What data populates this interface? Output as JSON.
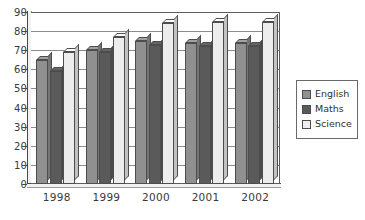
{
  "chart_data": {
    "type": "bar",
    "title": "",
    "xlabel": "",
    "ylabel": "",
    "categories": [
      "1998",
      "1999",
      "2000",
      "2001",
      "2002"
    ],
    "series": [
      {
        "name": "English",
        "color": "#909090",
        "values": [
          65,
          70,
          75,
          74,
          74
        ]
      },
      {
        "name": "Maths",
        "color": "#5a5a5a",
        "values": [
          59,
          69,
          73,
          72,
          72
        ]
      },
      {
        "name": "Science",
        "color": "#ededed",
        "values": [
          69,
          77,
          84,
          85,
          85
        ]
      }
    ],
    "ylim": [
      0,
      90
    ],
    "ytick_step": 10,
    "yticks": [
      "0",
      "10",
      "20",
      "30",
      "40",
      "50",
      "60",
      "70",
      "80",
      "90"
    ],
    "grid": true,
    "legend_position": "right",
    "style": "3d-column"
  },
  "legend": {
    "items": [
      {
        "label": "English",
        "color": "#909090"
      },
      {
        "label": "Maths",
        "color": "#5a5a5a"
      },
      {
        "label": "Science",
        "color": "#ededed"
      }
    ]
  },
  "colors": {
    "axis": "#4a4a4a",
    "grid": "#8b8b8b",
    "text": "#3a3a3a",
    "background": "#ffffff"
  }
}
